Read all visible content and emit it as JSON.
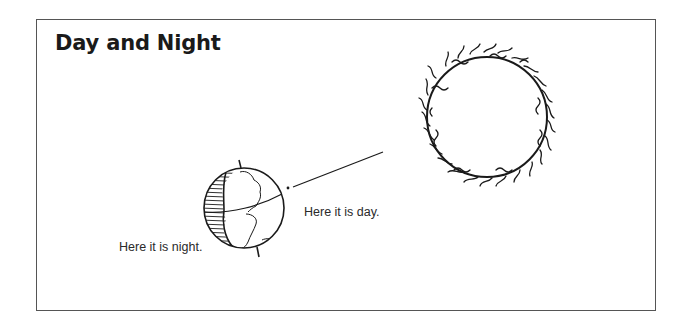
{
  "title": "Day and Night",
  "labels": {
    "night": "Here it is night.",
    "day": "Here it is day."
  },
  "colors": {
    "ink": "#1a1a1a",
    "frame": "#555555",
    "background": "#ffffff"
  }
}
